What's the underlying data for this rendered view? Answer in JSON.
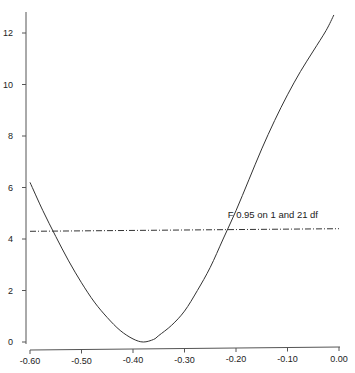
{
  "chart_data": {
    "type": "line",
    "title": "",
    "xlabel": "",
    "ylabel": "",
    "xlim": [
      -0.6,
      0.0
    ],
    "ylim": [
      0,
      12.7
    ],
    "grid": false,
    "legend": null,
    "x_ticks": [
      "-0.60",
      "-0.50",
      "-0.40",
      "-0.30",
      "-0.20",
      "-0.10",
      "0.00"
    ],
    "y_ticks": [
      "0",
      "2",
      "4",
      "6",
      "8",
      "10",
      "12"
    ],
    "series": [
      {
        "name": "F statistic profile",
        "style": "solid",
        "x": [
          -0.6,
          -0.575,
          -0.55,
          -0.525,
          -0.5,
          -0.475,
          -0.45,
          -0.425,
          -0.4,
          -0.38,
          -0.36,
          -0.35,
          -0.325,
          -0.3,
          -0.275,
          -0.25,
          -0.225,
          -0.2,
          -0.175,
          -0.15,
          -0.125,
          -0.1,
          -0.075,
          -0.05,
          -0.025,
          -0.01
        ],
        "y": [
          6.2,
          5.1,
          4.1,
          3.15,
          2.3,
          1.55,
          0.95,
          0.45,
          0.12,
          0.0,
          0.1,
          0.25,
          0.65,
          1.2,
          2.0,
          2.9,
          4.0,
          5.1,
          6.3,
          7.5,
          8.6,
          9.6,
          10.5,
          11.3,
          12.1,
          12.7
        ]
      },
      {
        "name": "F 0.95 on 1 and 21 df",
        "style": "dashdot",
        "x": [
          -0.6,
          0.0
        ],
        "y": [
          4.3,
          4.4
        ]
      }
    ],
    "annotations": [
      {
        "text": "F 0.95 on 1 and 21 df",
        "x": -0.22,
        "y": 4.9
      }
    ]
  }
}
